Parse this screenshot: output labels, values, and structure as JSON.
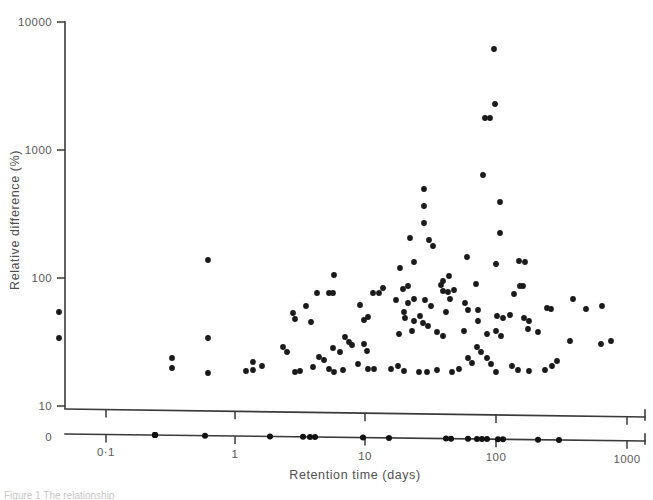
{
  "figure": {
    "caption_fragment": "Figure 1 The relationship"
  },
  "chart_data": {
    "type": "scatter",
    "title": "",
    "xlabel": "Retention time (days)",
    "ylabel": "Relative difference (%)",
    "xscale": "log",
    "yscale": "log",
    "xlim": [
      0.05,
      1000
    ],
    "ylim": [
      10,
      10000
    ],
    "grid": false,
    "legend": null,
    "x_ticks": [
      {
        "value": 0.1,
        "label": "0·1",
        "px": 106
      },
      {
        "value": 1,
        "label": "1",
        "px": 235
      },
      {
        "value": 10,
        "label": "10",
        "px": 365
      },
      {
        "value": 100,
        "label": "100",
        "px": 496
      },
      {
        "value": 1000,
        "label": "1000",
        "px": 627
      }
    ],
    "y_ticks": [
      {
        "value": 10,
        "label": "10",
        "px": 406
      },
      {
        "value": 100,
        "label": "100",
        "px": 278
      },
      {
        "value": 1000,
        "label": "1000",
        "px": 150
      },
      {
        "value": 10000,
        "label": "10000",
        "px": 22
      }
    ],
    "broken_axis": {
      "zero_label": "0",
      "zero_label_px": 437,
      "note": "secondary baseline axis showing a rug of retention-time values"
    },
    "points_px": [
      [
        494,
        49
      ],
      [
        495,
        104
      ],
      [
        485,
        118
      ],
      [
        490,
        118
      ],
      [
        483,
        175
      ],
      [
        424,
        189
      ],
      [
        424,
        206
      ],
      [
        424,
        223
      ],
      [
        500,
        202
      ],
      [
        500,
        233
      ],
      [
        410,
        238
      ],
      [
        414,
        262
      ],
      [
        467,
        257
      ],
      [
        496,
        264
      ],
      [
        433,
        246
      ],
      [
        429,
        240
      ],
      [
        208,
        260
      ],
      [
        519,
        261
      ],
      [
        525,
        262
      ],
      [
        400,
        268
      ],
      [
        396,
        300
      ],
      [
        449,
        276
      ],
      [
        403,
        289
      ],
      [
        408,
        286
      ],
      [
        441,
        285
      ],
      [
        443,
        281
      ],
      [
        443,
        291
      ],
      [
        476,
        284
      ],
      [
        520,
        286
      ],
      [
        523,
        286
      ],
      [
        454,
        290
      ],
      [
        408,
        303
      ],
      [
        414,
        299
      ],
      [
        448,
        292
      ],
      [
        450,
        299
      ],
      [
        514,
        294
      ],
      [
        383,
        288
      ],
      [
        373,
        293
      ],
      [
        379,
        293
      ],
      [
        334,
        275
      ],
      [
        317,
        293
      ],
      [
        329,
        293
      ],
      [
        333,
        293
      ],
      [
        293,
        313
      ],
      [
        295,
        319
      ],
      [
        59,
        312
      ],
      [
        59,
        338
      ],
      [
        425,
        300
      ],
      [
        431,
        306
      ],
      [
        465,
        303
      ],
      [
        468,
        310
      ],
      [
        404,
        312
      ],
      [
        420,
        316
      ],
      [
        446,
        312
      ],
      [
        478,
        310
      ],
      [
        405,
        318
      ],
      [
        414,
        321
      ],
      [
        497,
        316
      ],
      [
        503,
        318
      ],
      [
        423,
        323
      ],
      [
        428,
        326
      ],
      [
        478,
        321
      ],
      [
        510,
        315
      ],
      [
        524,
        318
      ],
      [
        529,
        321
      ],
      [
        547,
        308
      ],
      [
        551,
        309
      ],
      [
        586,
        309
      ],
      [
        573,
        299
      ],
      [
        602,
        306
      ],
      [
        360,
        305
      ],
      [
        368,
        317
      ],
      [
        364,
        320
      ],
      [
        306,
        306
      ],
      [
        311,
        322
      ],
      [
        208,
        338
      ],
      [
        172,
        358
      ],
      [
        172,
        368
      ],
      [
        208,
        373
      ],
      [
        399,
        334
      ],
      [
        412,
        331
      ],
      [
        437,
        332
      ],
      [
        443,
        336
      ],
      [
        464,
        331
      ],
      [
        487,
        334
      ],
      [
        496,
        331
      ],
      [
        501,
        336
      ],
      [
        528,
        329
      ],
      [
        538,
        332
      ],
      [
        557,
        361
      ],
      [
        570,
        341
      ],
      [
        601,
        344
      ],
      [
        611,
        341
      ],
      [
        345,
        337
      ],
      [
        349,
        342
      ],
      [
        352,
        345
      ],
      [
        364,
        344
      ],
      [
        333,
        348
      ],
      [
        340,
        352
      ],
      [
        283,
        347
      ],
      [
        287,
        352
      ],
      [
        246,
        371
      ],
      [
        253,
        370
      ],
      [
        295,
        372
      ],
      [
        300,
        371
      ],
      [
        313,
        367
      ],
      [
        329,
        369
      ],
      [
        334,
        372
      ],
      [
        343,
        370
      ],
      [
        358,
        364
      ],
      [
        368,
        369
      ],
      [
        374,
        369
      ],
      [
        391,
        369
      ],
      [
        398,
        366
      ],
      [
        404,
        371
      ],
      [
        419,
        372
      ],
      [
        427,
        372
      ],
      [
        437,
        370
      ],
      [
        452,
        372
      ],
      [
        459,
        369
      ],
      [
        468,
        358
      ],
      [
        472,
        363
      ],
      [
        487,
        358
      ],
      [
        491,
        364
      ],
      [
        496,
        372
      ],
      [
        512,
        366
      ],
      [
        518,
        370
      ],
      [
        529,
        371
      ],
      [
        545,
        370
      ],
      [
        552,
        366
      ],
      [
        477,
        347
      ],
      [
        481,
        352
      ],
      [
        367,
        351
      ],
      [
        319,
        357
      ],
      [
        324,
        360
      ],
      [
        253,
        362
      ],
      [
        262,
        366
      ]
    ],
    "rug_points_px": [
      [
        155,
        437
      ],
      [
        155,
        440
      ],
      [
        155,
        434
      ],
      [
        205,
        437
      ],
      [
        270,
        437
      ],
      [
        303,
        437
      ],
      [
        310,
        437
      ],
      [
        315,
        437
      ],
      [
        363,
        437
      ],
      [
        389,
        437
      ],
      [
        446,
        437
      ],
      [
        451,
        437
      ],
      [
        468,
        437
      ],
      [
        477,
        437
      ],
      [
        482,
        437
      ],
      [
        487,
        437
      ],
      [
        498,
        437
      ],
      [
        503,
        437
      ],
      [
        538,
        437
      ],
      [
        559,
        437
      ]
    ]
  }
}
